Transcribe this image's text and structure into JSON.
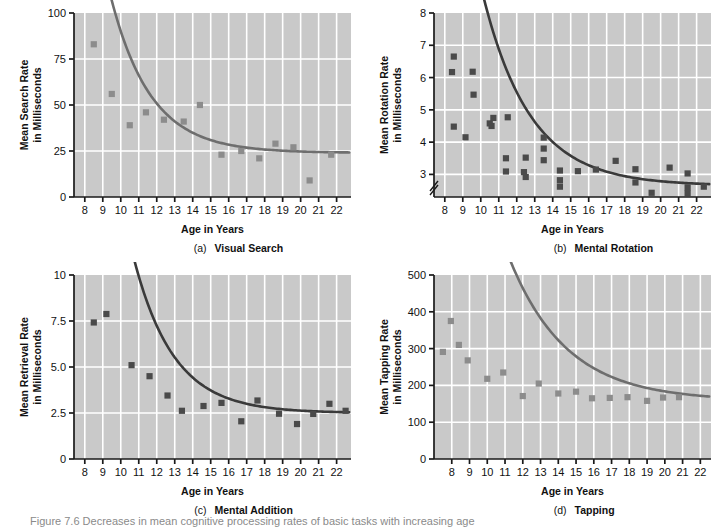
{
  "figure": {
    "caption": "Figure 7.6  Decreases in mean cognitive processing rates of basic tasks with  increasing age",
    "background_color": "#ffffff",
    "plot_background_color": "#c9c9c9",
    "gridline_color": "#ffffff",
    "axis_color": "#1a1a1a"
  },
  "chart_data": [
    {
      "type": "scatter",
      "id": "a",
      "panel_letter": "(a)",
      "panel_title": "Visual Search",
      "title": "Visual Search",
      "xlabel": "Age in Years",
      "ylabel": "Mean Search Rate\nin Milliseconds",
      "ylabel_line1": "Mean Search Rate",
      "ylabel_line2": "in Milliseconds",
      "xlim": [
        7.4,
        22.8
      ],
      "ylim": [
        0,
        100
      ],
      "xticks": [
        8,
        9,
        10,
        11,
        12,
        13,
        14,
        15,
        16,
        17,
        18,
        19,
        20,
        21,
        22
      ],
      "xticklabels": [
        "8",
        "9",
        "10",
        "11",
        "12",
        "13",
        "14",
        "15",
        "16",
        "17",
        "18",
        "19",
        "20",
        "21",
        "22"
      ],
      "yticks": [
        0,
        25,
        50,
        75,
        100
      ],
      "yticklabels": [
        "0",
        "25",
        "50",
        "75",
        "100"
      ],
      "grid": true,
      "axis_break": false,
      "marker_color": "#8c8c8c",
      "curve_color": "#6e6e6e",
      "points": [
        {
          "x": 8.5,
          "y": 83
        },
        {
          "x": 9.5,
          "y": 56
        },
        {
          "x": 10.5,
          "y": 39
        },
        {
          "x": 11.4,
          "y": 46
        },
        {
          "x": 12.4,
          "y": 42
        },
        {
          "x": 13.5,
          "y": 41
        },
        {
          "x": 14.4,
          "y": 50
        },
        {
          "x": 15.6,
          "y": 23
        },
        {
          "x": 16.7,
          "y": 25
        },
        {
          "x": 17.7,
          "y": 21
        },
        {
          "x": 18.6,
          "y": 29
        },
        {
          "x": 19.6,
          "y": 27
        },
        {
          "x": 20.5,
          "y": 9
        },
        {
          "x": 21.7,
          "y": 23
        }
      ],
      "curve": {
        "asymptote": 24,
        "amplitude": 170,
        "decay": 0.45,
        "x_start": 7.9,
        "x_end": 22.7
      }
    },
    {
      "type": "scatter",
      "id": "b",
      "panel_letter": "(b)",
      "panel_title": "Mental Rotation",
      "title": "Mental Rotation",
      "xlabel": "Age in Years",
      "ylabel": "Mean Rotation Rate\nin Milliseconds",
      "ylabel_line1": "Mean Rotation Rate",
      "ylabel_line2": "in Milliseconds",
      "xlim": [
        7.4,
        22.8
      ],
      "ylim": [
        2.3,
        8
      ],
      "xticks": [
        8,
        9,
        10,
        11,
        12,
        13,
        14,
        15,
        16,
        17,
        18,
        19,
        20,
        21,
        22
      ],
      "xticklabels": [
        "8",
        "9",
        "10",
        "11",
        "12",
        "13",
        "14",
        "15",
        "16",
        "17",
        "18",
        "19",
        "20",
        "21",
        "22"
      ],
      "yticks": [
        3,
        4,
        5,
        6,
        7,
        8
      ],
      "yticklabels": [
        "3",
        "4",
        "5",
        "6",
        "7",
        "8"
      ],
      "grid": true,
      "axis_break": true,
      "marker_color": "#4a4a4a",
      "curve_color": "#3a3a3a",
      "points": [
        {
          "x": 8.5,
          "y": 6.65
        },
        {
          "x": 8.4,
          "y": 6.17
        },
        {
          "x": 9.55,
          "y": 6.18
        },
        {
          "x": 9.6,
          "y": 5.47
        },
        {
          "x": 8.5,
          "y": 4.48
        },
        {
          "x": 9.15,
          "y": 4.15
        },
        {
          "x": 10.5,
          "y": 4.58
        },
        {
          "x": 10.7,
          "y": 4.75
        },
        {
          "x": 10.6,
          "y": 4.5
        },
        {
          "x": 11.5,
          "y": 4.77
        },
        {
          "x": 11.4,
          "y": 3.5
        },
        {
          "x": 11.4,
          "y": 3.09
        },
        {
          "x": 12.5,
          "y": 3.52
        },
        {
          "x": 12.4,
          "y": 3.07
        },
        {
          "x": 12.5,
          "y": 2.92
        },
        {
          "x": 13.5,
          "y": 4.14
        },
        {
          "x": 13.5,
          "y": 3.8
        },
        {
          "x": 13.5,
          "y": 3.44
        },
        {
          "x": 14.4,
          "y": 3.12
        },
        {
          "x": 14.4,
          "y": 2.82
        },
        {
          "x": 14.4,
          "y": 2.62
        },
        {
          "x": 15.4,
          "y": 3.1
        },
        {
          "x": 16.4,
          "y": 3.15
        },
        {
          "x": 17.5,
          "y": 3.42
        },
        {
          "x": 18.6,
          "y": 3.16
        },
        {
          "x": 18.6,
          "y": 2.75
        },
        {
          "x": 19.5,
          "y": 2.43
        },
        {
          "x": 20.5,
          "y": 3.21
        },
        {
          "x": 21.5,
          "y": 3.03
        },
        {
          "x": 21.5,
          "y": 2.6
        },
        {
          "x": 21.5,
          "y": 2.42
        },
        {
          "x": 22.4,
          "y": 2.62
        }
      ],
      "curve": {
        "asymptote": 2.65,
        "amplitude": 13.5,
        "decay": 0.38,
        "x_start": 7.95,
        "x_end": 22.7
      }
    },
    {
      "type": "scatter",
      "id": "c",
      "panel_letter": "(c)",
      "panel_title": "Mental Addition",
      "title": "Mental Addition",
      "xlabel": "Age in Years",
      "ylabel": "Mean Retrieval Rate\nin Milliseconds",
      "ylabel_line1": "Mean Retrieval Rate",
      "ylabel_line2": "in Milliseconds",
      "xlim": [
        7.4,
        22.8
      ],
      "ylim": [
        0,
        10
      ],
      "xticks": [
        8,
        9,
        10,
        11,
        12,
        13,
        14,
        15,
        16,
        17,
        18,
        19,
        20,
        21,
        22
      ],
      "xticklabels": [
        "8",
        "9",
        "10",
        "11",
        "12",
        "13",
        "14",
        "15",
        "16",
        "17",
        "18",
        "19",
        "20",
        "21",
        "22"
      ],
      "yticks": [
        0,
        2.5,
        5.0,
        7.5,
        10
      ],
      "yticklabels": [
        "0",
        "2.5",
        "5.0",
        "7.5",
        "10"
      ],
      "grid": true,
      "axis_break": false,
      "marker_color": "#4a4a4a",
      "curve_color": "#3a3a3a",
      "points": [
        {
          "x": 8.5,
          "y": 7.42
        },
        {
          "x": 9.2,
          "y": 7.88
        },
        {
          "x": 10.6,
          "y": 5.1
        },
        {
          "x": 11.6,
          "y": 4.5
        },
        {
          "x": 12.6,
          "y": 3.45
        },
        {
          "x": 13.4,
          "y": 2.62
        },
        {
          "x": 14.6,
          "y": 2.88
        },
        {
          "x": 15.6,
          "y": 3.05
        },
        {
          "x": 16.7,
          "y": 2.05
        },
        {
          "x": 17.6,
          "y": 3.18
        },
        {
          "x": 18.8,
          "y": 2.46
        },
        {
          "x": 19.8,
          "y": 1.9
        },
        {
          "x": 20.7,
          "y": 2.45
        },
        {
          "x": 21.6,
          "y": 3.0
        },
        {
          "x": 22.5,
          "y": 2.62
        }
      ],
      "curve": {
        "asymptote": 2.5,
        "amplitude": 30,
        "decay": 0.45,
        "x_start": 7.9,
        "x_end": 22.7
      }
    },
    {
      "type": "scatter",
      "id": "d",
      "panel_letter": "(d)",
      "panel_title": "Tapping",
      "title": "Tapping",
      "xlabel": "Age in Years",
      "ylabel": "Mean Tapping Rate\nin Milliseconds",
      "ylabel_line1": "Mean Tapping Rate",
      "ylabel_line2": "in Milliseconds",
      "xlim": [
        7.0,
        22.6
      ],
      "ylim": [
        0,
        500
      ],
      "xticks": [
        8,
        9,
        10,
        11,
        12,
        13,
        14,
        15,
        16,
        17,
        18,
        19,
        20,
        21,
        22
      ],
      "xticklabels": [
        "8",
        "9",
        "10",
        "11",
        "12",
        "13",
        "14",
        "15",
        "16",
        "17",
        "18",
        "19",
        "20",
        "21",
        "22"
      ],
      "yticks": [
        0,
        100,
        200,
        300,
        400,
        500
      ],
      "yticklabels": [
        "0",
        "100",
        "200",
        "300",
        "400",
        "500"
      ],
      "grid": true,
      "axis_break": false,
      "marker_color": "#8c8c8c",
      "curve_color": "#6e6e6e",
      "points": [
        {
          "x": 7.5,
          "y": 291
        },
        {
          "x": 7.95,
          "y": 375
        },
        {
          "x": 8.4,
          "y": 310
        },
        {
          "x": 8.9,
          "y": 268
        },
        {
          "x": 10.0,
          "y": 218
        },
        {
          "x": 10.9,
          "y": 235
        },
        {
          "x": 12.0,
          "y": 171
        },
        {
          "x": 12.9,
          "y": 205
        },
        {
          "x": 14.0,
          "y": 178
        },
        {
          "x": 15.0,
          "y": 183
        },
        {
          "x": 15.9,
          "y": 165
        },
        {
          "x": 16.9,
          "y": 166
        },
        {
          "x": 17.9,
          "y": 168
        },
        {
          "x": 19.0,
          "y": 158
        },
        {
          "x": 19.9,
          "y": 167
        },
        {
          "x": 20.8,
          "y": 168
        }
      ],
      "curve": {
        "asymptote": 158,
        "amplitude": 1400,
        "decay": 0.31,
        "x_start": 7.1,
        "x_end": 22.5
      }
    }
  ]
}
